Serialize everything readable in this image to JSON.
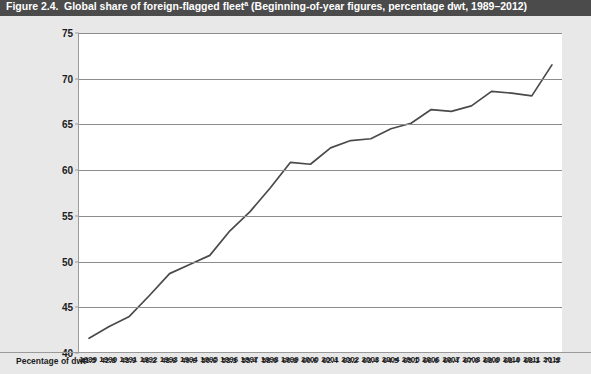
{
  "figure": {
    "number": "Figure 2.4.",
    "title": "Global share of foreign-flagged fleet",
    "title_footnote_marker": "a",
    "subtitle": "(Beginning-of-year figures, percentage dwt, 1989–2012)"
  },
  "table": {
    "row_label": "Pecentage of dwt"
  },
  "style": {
    "title_bar_bg": "#4b4b4b",
    "title_bar_text": "#ffffff",
    "page_bg": "#e8e8e8",
    "plot_bg": "#ffffff",
    "gridline_color": "#8d8d8d",
    "axis_color": "#9a9a9a",
    "series_color": "#4a4a4a",
    "label_color": "#1c1c1c"
  },
  "chart_data": {
    "type": "line",
    "title": "Global share of foreign-flagged fleet",
    "subtitle": "(Beginning-of-year figures, percentage dwt, 1989–2012)",
    "xlabel": "",
    "ylabel": "",
    "ylim": [
      40,
      75
    ],
    "yticks": [
      40,
      45,
      50,
      55,
      60,
      65,
      70,
      75
    ],
    "grid": "horizontal",
    "legend": "none",
    "x": [
      1989,
      1990,
      1991,
      1992,
      1993,
      1994,
      1995,
      1996,
      1997,
      1998,
      1999,
      2000,
      2001,
      2002,
      2003,
      2004,
      2005,
      2006,
      2007,
      2008,
      2009,
      2010,
      2011,
      2012
    ],
    "categories": [
      "1989",
      "1990",
      "1991",
      "1992",
      "1993",
      "1994",
      "1995",
      "1996",
      "1997",
      "1998",
      "1999",
      "2000",
      "2001",
      "2002",
      "2003",
      "2004",
      "2005",
      "2006",
      "2007",
      "2008",
      "2009",
      "2010",
      "2011",
      "2012"
    ],
    "values": [
      41.5,
      42.8,
      43.9,
      46.2,
      48.6,
      49.6,
      50.6,
      53.3,
      55.4,
      58.0,
      60.8,
      60.6,
      62.4,
      63.2,
      63.4,
      64.5,
      65.1,
      66.6,
      66.4,
      67.0,
      68.6,
      68.4,
      68.1,
      71.5
    ],
    "value_labels": [
      "41.5",
      "42.8",
      "43.9",
      "46.2",
      "48.6",
      "49.6",
      "50.6",
      "53.3",
      "55.4",
      "58.0",
      "60.8",
      "60.6",
      "62.4",
      "63.2",
      "63.4",
      "64.5",
      "65.1",
      "66.6",
      "66.4",
      "67.0",
      "68.6",
      "68.4",
      "68.1",
      "71.5"
    ],
    "series": [
      {
        "name": "Percentage of dwt",
        "values": [
          41.5,
          42.8,
          43.9,
          46.2,
          48.6,
          49.6,
          50.6,
          53.3,
          55.4,
          58.0,
          60.8,
          60.6,
          62.4,
          63.2,
          63.4,
          64.5,
          65.1,
          66.6,
          66.4,
          67.0,
          68.6,
          68.4,
          68.1,
          71.5
        ]
      }
    ]
  }
}
